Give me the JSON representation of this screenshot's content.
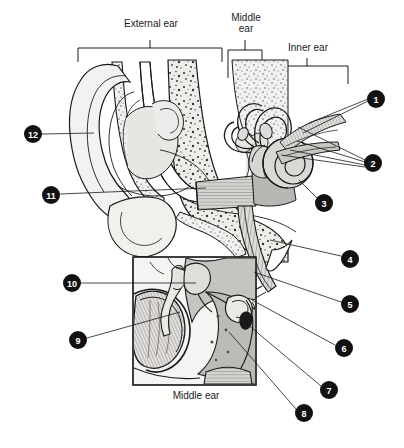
{
  "figure": {
    "background_color": "#ffffff",
    "ink_color": "#1a1a1a",
    "callout_fill": "#111111",
    "callout_text_color": "#ffffff",
    "tissue_light": "#f2f0ee",
    "tissue_mid": "#cfcdca",
    "tissue_dark": "#a9a7a4"
  },
  "section_brackets": [
    {
      "id": "external-ear",
      "label": "External ear",
      "x_start": 78,
      "x_end": 222,
      "y": 48,
      "tick_x": 150
    },
    {
      "id": "middle-ear",
      "label": "Middle\near",
      "x_start": 228,
      "x_end": 262,
      "y": 48,
      "tick_x": 245
    },
    {
      "id": "inner-ear",
      "label": "Inner ear",
      "x_start": 265,
      "x_end": 348,
      "y": 65,
      "tick_x": 306
    }
  ],
  "header_labels": {
    "external": "External ear",
    "middle_line1": "Middle",
    "middle_line2": "ear",
    "inner": "Inner ear"
  },
  "inset": {
    "caption": "Middle ear",
    "box": {
      "x": 133,
      "y": 257,
      "width": 123,
      "height": 128
    },
    "caption_x": 196,
    "caption_y": 397
  },
  "callouts": [
    {
      "number": "1",
      "cx": 376,
      "cy": 99,
      "r": 9,
      "leader_targets": [
        [
          309,
          123
        ],
        [
          305,
          133
        ]
      ]
    },
    {
      "number": "2",
      "cx": 373,
      "cy": 163,
      "r": 9,
      "leader_targets": [
        [
          300,
          140
        ],
        [
          292,
          148
        ],
        [
          283,
          152
        ],
        [
          296,
          128
        ]
      ]
    },
    {
      "number": "3",
      "cx": 324,
      "cy": 203,
      "r": 9,
      "leader_targets": [
        [
          299,
          180
        ]
      ]
    },
    {
      "number": "4",
      "cx": 350,
      "cy": 259,
      "r": 9,
      "leader_targets": [
        [
          272,
          241
        ]
      ]
    },
    {
      "number": "5",
      "cx": 350,
      "cy": 304,
      "r": 9,
      "leader_targets": [
        [
          256,
          273
        ]
      ]
    },
    {
      "number": "6",
      "cx": 344,
      "cy": 348,
      "r": 9,
      "leader_targets": [
        [
          256,
          301
        ]
      ]
    },
    {
      "number": "7",
      "cx": 329,
      "cy": 390,
      "r": 9,
      "leader_targets": [
        [
          242,
          320
        ]
      ]
    },
    {
      "number": "8",
      "cx": 304,
      "cy": 413,
      "r": 9,
      "leader_targets": [
        [
          231,
          333
        ]
      ]
    },
    {
      "number": "9",
      "cx": 78,
      "cy": 340,
      "r": 9,
      "leader_targets": [
        [
          180,
          312
        ]
      ]
    },
    {
      "number": "10",
      "cx": 72,
      "cy": 283,
      "r": 9,
      "leader_targets": [
        [
          196,
          283
        ]
      ]
    },
    {
      "number": "11",
      "cx": 51,
      "cy": 195,
      "r": 9,
      "leader_targets": [
        [
          205,
          189
        ]
      ]
    },
    {
      "number": "12",
      "cx": 33,
      "cy": 134,
      "r": 9,
      "leader_targets": [
        [
          93,
          133
        ]
      ]
    }
  ],
  "anatomy_parts": [
    {
      "id": "pinna",
      "name": "Pinna (auricle)"
    },
    {
      "id": "ear-canal",
      "name": "External auditory canal"
    },
    {
      "id": "tympanic-membrane",
      "name": "Tympanic membrane (eardrum)"
    },
    {
      "id": "malleus",
      "name": "Malleus"
    },
    {
      "id": "incus",
      "name": "Incus"
    },
    {
      "id": "stapes",
      "name": "Stapes"
    },
    {
      "id": "oval-window",
      "name": "Oval window"
    },
    {
      "id": "cochlea",
      "name": "Cochlea"
    },
    {
      "id": "semicircular-canals",
      "name": "Semicircular canals"
    },
    {
      "id": "vestibular-nerve",
      "name": "Vestibular nerve"
    },
    {
      "id": "cochlear-nerve",
      "name": "Cochlear nerve"
    },
    {
      "id": "eustachian-tube",
      "name": "Eustachian (auditory) tube"
    },
    {
      "id": "temporal-bone",
      "name": "Temporal bone"
    },
    {
      "id": "lobule",
      "name": "Earlobe (lobule)"
    }
  ]
}
